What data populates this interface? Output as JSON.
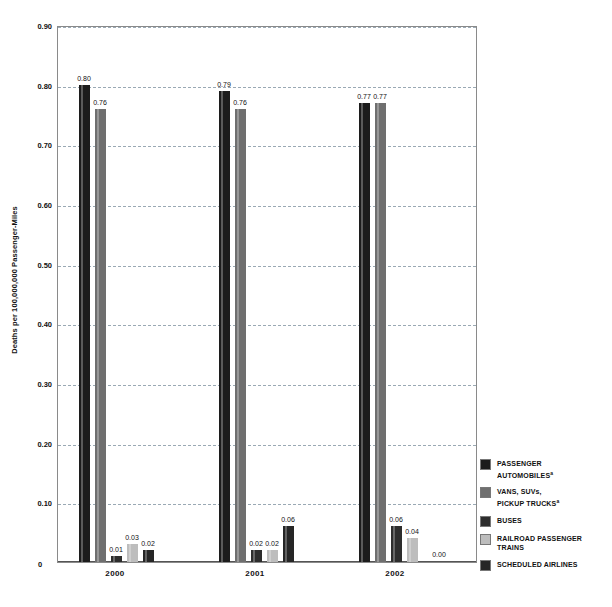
{
  "chart_data": {
    "type": "bar",
    "title": "",
    "subtitle": "",
    "xlabel": "",
    "ylabel": "Deaths per 100,000,000 Passenger-Miles",
    "categories": [
      "2000",
      "2001",
      "2002"
    ],
    "ylim": [
      0,
      0.9
    ],
    "ytick_labels": [
      "0.90",
      "0.80",
      "0.70",
      "0.60",
      "0.50",
      "0.40",
      "0.30",
      "0.20",
      "0.10",
      "0"
    ],
    "ytick_values": [
      0.9,
      0.8,
      0.7,
      0.6,
      0.5,
      0.4,
      0.3,
      0.2,
      0.1,
      0
    ],
    "grid": "horizontal-dashed",
    "legend_position": "right-bottom",
    "series": [
      {
        "name": "PASSENGER AUTOMOBILES",
        "footnote": "a",
        "color": "#1c1c1c",
        "values": [
          0.8,
          0.79,
          0.77
        ],
        "labels": [
          "0.80",
          "0.79",
          "0.77"
        ]
      },
      {
        "name": "VANS, SUVs, PICKUP TRUCKS",
        "footnote": "a",
        "color": "#6f6f6f",
        "values": [
          0.76,
          0.76,
          0.77
        ],
        "labels": [
          "0.76",
          "0.76",
          "0.77"
        ]
      },
      {
        "name": "BUSES",
        "footnote": "",
        "color": "#2d2d2d",
        "values": [
          0.01,
          0.02,
          0.06
        ],
        "labels": [
          "0.01",
          "0.02",
          "0.06"
        ]
      },
      {
        "name": "RAILROAD PASSENGER TRAINS",
        "footnote": "",
        "color": "#bdbdbd",
        "values": [
          0.03,
          0.02,
          0.04
        ],
        "labels": [
          "0.03",
          "0.02",
          "0.04"
        ]
      },
      {
        "name": "SCHEDULED AIRLINES",
        "footnote": "",
        "color": "#262626",
        "values": [
          0.02,
          0.06,
          0.0
        ],
        "labels": [
          "0.02",
          "0.06",
          "0.00"
        ]
      }
    ]
  },
  "legend": {
    "items": [
      {
        "line1": "PASSENGER",
        "line2": "AUTOMOBILES",
        "sup": "a",
        "color": "#1c1c1c"
      },
      {
        "line1": "VANS, SUVs,",
        "line2": "PICKUP TRUCKS",
        "sup": "a",
        "color": "#6f6f6f"
      },
      {
        "line1": "BUSES",
        "line2": "",
        "sup": "",
        "color": "#2d2d2d"
      },
      {
        "line1": "RAILROAD PASSENGER",
        "line2": "TRAINS",
        "sup": "",
        "color": "#bdbdbd"
      },
      {
        "line1": "SCHEDULED AIRLINES",
        "line2": "",
        "sup": "",
        "color": "#262626"
      }
    ]
  },
  "axes": {
    "y_title": "Deaths per 100,000,000 Passenger-Miles",
    "zero_label": "0"
  }
}
